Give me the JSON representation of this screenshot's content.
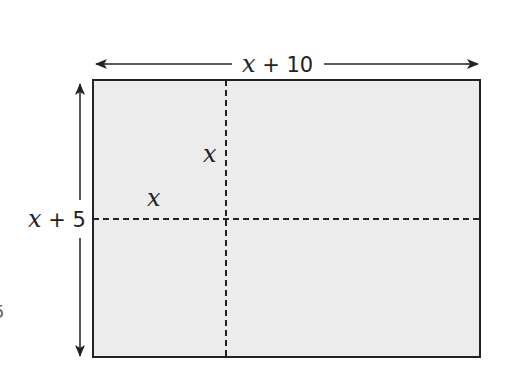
{
  "diagram": {
    "type": "area-model rectangle",
    "fill_color": "#ececec",
    "stroke_color": "#222222",
    "labels": {
      "width": {
        "var": "x",
        "rest": " + 10"
      },
      "height": {
        "var": "x",
        "rest": " + 5"
      },
      "inner_vertical": "x",
      "inner_horizontal": "x"
    },
    "edge_fragment": "5"
  }
}
